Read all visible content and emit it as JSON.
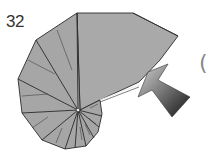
{
  "diagram": {
    "step_number": "32",
    "paren_glyph": "(",
    "colors": {
      "paper_fill": "#a9a9a9",
      "crease_line": "#2a2a2a",
      "arrow_light": "#c8c8c8",
      "arrow_dark": "#1e1e1e"
    }
  }
}
